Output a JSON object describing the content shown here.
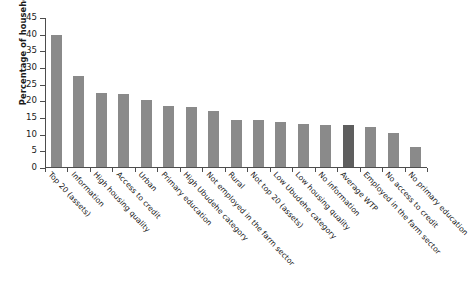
{
  "chart_data": {
    "type": "bar",
    "title": "",
    "xlabel": "",
    "ylabel": "Percentage of households",
    "ylim": [
      0,
      45
    ],
    "yticks": [
      0,
      5,
      10,
      15,
      20,
      25,
      30,
      35,
      40,
      45
    ],
    "grid": false,
    "legend": "none",
    "bar_color": "#8a8a8a",
    "highlight_color": "#5e5e5e",
    "highlight_category": "Average WTP",
    "categories": [
      "Top 20 (assets)",
      "Information",
      "High housing quality",
      "Access to credit",
      "Urban",
      "Primary education",
      "High Ubudehe category",
      "Not employed in the farm sector",
      "Rural",
      "Not top 20 (assets)",
      "Low Ubudehe category",
      "Low housing quality",
      "No information",
      "Average WTP",
      "Employed in the farm sector",
      "No access to credit",
      "No primary education"
    ],
    "values": [
      39.5,
      27.3,
      22.3,
      22.0,
      20.2,
      18.4,
      17.9,
      16.8,
      14.2,
      14.0,
      13.6,
      12.9,
      12.6,
      12.5,
      12.1,
      10.1,
      6.0
    ]
  }
}
